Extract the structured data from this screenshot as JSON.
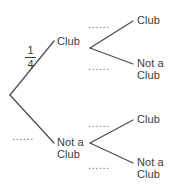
{
  "diagram": {
    "type": "probability-tree",
    "title": "",
    "background_color": "#ffffff",
    "line_color": "#4a4a4a",
    "text_color": "#3b3b3b",
    "dotted_label_color": "#6d6d6d",
    "nodes": {
      "root": {
        "label": "",
        "x": 10,
        "y": 95
      },
      "level1": [
        {
          "id": "club",
          "label": "Club",
          "x": 57,
          "y": 41,
          "text_x": 57,
          "text_y": 35
        },
        {
          "id": "not-a-club",
          "label": "Not a\nClub",
          "x": 57,
          "y": 143,
          "text_x": 57,
          "text_y": 137
        }
      ],
      "level2": [
        {
          "id": "club-club",
          "label": "Club",
          "x": 137,
          "y": 20,
          "parent": "club"
        },
        {
          "id": "club-not-a-club",
          "label": "Not a\nClub",
          "x": 137,
          "y": 62,
          "parent": "club"
        },
        {
          "id": "not-a-club-club",
          "label": "Club",
          "x": 137,
          "y": 119,
          "parent": "not-a-club"
        },
        {
          "id": "not-a-club-not-a-club",
          "label": "Not a\nClub",
          "x": 137,
          "y": 161,
          "parent": "not-a-club"
        }
      ]
    },
    "branch_labels": {
      "root_to_club": {
        "type": "fraction",
        "numerator": "1",
        "denominator": "4",
        "x": 26,
        "y": 48
      },
      "root_to_not_a_club": {
        "type": "dots",
        "text": "......",
        "x": 12,
        "y": 131
      },
      "club_to_club": {
        "type": "dots",
        "text": "......",
        "x": 88,
        "y": 19
      },
      "club_to_not_a_club": {
        "type": "dots",
        "text": "......",
        "x": 88,
        "y": 61
      },
      "not_a_club_to_club": {
        "type": "dots",
        "text": "......",
        "x": 88,
        "y": 118
      },
      "not_a_club_to_not_a_club": {
        "type": "dots",
        "text": "......",
        "x": 88,
        "y": 160
      }
    }
  }
}
